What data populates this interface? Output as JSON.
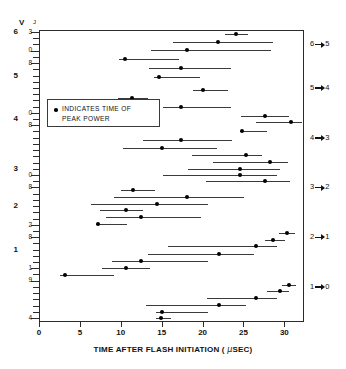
{
  "axis_header": {
    "v_label": "V",
    "j_label": "J"
  },
  "legend": {
    "line1": "INDICATES TIME OF",
    "line2": "PEAK POWER",
    "marker": "peak-power-dot"
  },
  "chart_data": {
    "type": "scatter",
    "title": "",
    "xlabel": "TIME AFTER FLASH INITIATION ( μSEC)",
    "ylabel": "V  J",
    "xlim": [
      0,
      32.4
    ],
    "ylim": [
      0,
      42
    ],
    "grid": false,
    "legend_position": "inside-left",
    "xticks": [
      0,
      5,
      10,
      15,
      20,
      25,
      30
    ],
    "xticklabels": [
      "0",
      "5",
      "10",
      "15",
      "20",
      "25",
      "30"
    ],
    "y_axis_note": "Left axis: vibrational level V (bold) and rotational level J (small). Each row is one V,J state; horizontal bar = lasing duration, dot = time of peak power.",
    "v_labels": [
      {
        "v": "6",
        "row": 0
      },
      {
        "v": "5",
        "row": 7
      },
      {
        "v": "4",
        "row": 14
      },
      {
        "v": "3",
        "row": 22
      },
      {
        "v": "2",
        "row": 28
      },
      {
        "v": "1",
        "row": 35
      }
    ],
    "j_labels": [
      {
        "j": "3",
        "row": 0
      },
      {
        "j": "0",
        "row": 3
      },
      {
        "j": "8",
        "row": 5
      },
      {
        "j": "0",
        "row": 13
      },
      {
        "j": "8",
        "row": 15
      },
      {
        "j": "0",
        "row": 23
      },
      {
        "j": "8",
        "row": 25
      },
      {
        "j": "2",
        "row": 31
      },
      {
        "j": "8",
        "row": 33
      },
      {
        "j": "1",
        "row": 38
      },
      {
        "j": "9",
        "row": 40
      },
      {
        "j": "4",
        "row": 46
      }
    ],
    "transitions": [
      {
        "label_from": "6",
        "label_to": "5",
        "row": 2
      },
      {
        "label_from": "5",
        "label_to": "4",
        "row": 9
      },
      {
        "label_from": "4",
        "label_to": "3",
        "row": 17
      },
      {
        "label_from": "3",
        "label_to": "2",
        "row": 25
      },
      {
        "label_from": "2",
        "label_to": "1",
        "row": 33
      },
      {
        "label_from": "1",
        "label_to": "0",
        "row": 41
      }
    ],
    "series": [
      {
        "name": "lasing-line",
        "start": 22.6,
        "end": 25.4,
        "peak": 24.0,
        "y": 31.5
      },
      {
        "name": "lasing-line",
        "start": 16.2,
        "end": 28.5,
        "peak": 21.8,
        "y": 30.3
      },
      {
        "name": "lasing-line",
        "start": 13.6,
        "end": 28.2,
        "peak": 18.0,
        "y": 29.0
      },
      {
        "name": "lasing-line",
        "start": 9.6,
        "end": 17.0,
        "peak": 10.4,
        "y": 27.7
      },
      {
        "name": "lasing-line",
        "start": 13.3,
        "end": 23.3,
        "peak": 17.2,
        "y": 26.4
      },
      {
        "name": "lasing-line",
        "start": 13.9,
        "end": 19.6,
        "peak": 14.5,
        "y": 25.1
      },
      {
        "name": "lasing-line",
        "start": 18.7,
        "end": 23.0,
        "peak": 19.9,
        "y": 23.1
      },
      {
        "name": "lasing-line",
        "start": 9.5,
        "end": 13.2,
        "peak": 11.2,
        "y": 21.9
      },
      {
        "name": "lasing-line",
        "start": 15.0,
        "end": 23.3,
        "peak": 17.3,
        "y": 20.6
      },
      {
        "name": "lasing-line",
        "start": 24.6,
        "end": 30.5,
        "peak": 27.5,
        "y": 19.3
      },
      {
        "name": "lasing-line",
        "start": 26.4,
        "end": 32.0,
        "peak": 30.7,
        "y": 18.3
      },
      {
        "name": "lasing-line",
        "start": 24.5,
        "end": 27.7,
        "peak": 24.7,
        "y": 17.0
      },
      {
        "name": "lasing-line",
        "start": 12.6,
        "end": 23.5,
        "peak": 17.3,
        "y": 15.6
      },
      {
        "name": "lasing-line",
        "start": 10.2,
        "end": 21.6,
        "peak": 14.9,
        "y": 14.5
      },
      {
        "name": "lasing-line",
        "start": 18.6,
        "end": 27.2,
        "peak": 25.2,
        "y": 13.4
      },
      {
        "name": "lasing-line",
        "start": 21.2,
        "end": 30.3,
        "peak": 28.1,
        "y": 12.4
      },
      {
        "name": "lasing-line",
        "start": 18.1,
        "end": 29.4,
        "peak": 24.5,
        "y": 11.4
      },
      {
        "name": "lasing-line",
        "start": 15.0,
        "end": 29.0,
        "peak": 24.4,
        "y": 10.5
      },
      {
        "name": "lasing-line",
        "start": 20.3,
        "end": 30.6,
        "peak": 27.5,
        "y": 9.5
      },
      {
        "name": "lasing-line",
        "start": 9.9,
        "end": 14.0,
        "peak": 11.4,
        "y": 8.2
      },
      {
        "name": "lasing-line",
        "start": 9.1,
        "end": 25.0,
        "peak": 18.0,
        "y": 7.1
      },
      {
        "name": "lasing-line",
        "start": 6.2,
        "end": 20.6,
        "peak": 14.3,
        "y": 6.1
      },
      {
        "name": "lasing-line",
        "start": 7.3,
        "end": 12.6,
        "peak": 10.5,
        "y": 5.2
      },
      {
        "name": "lasing-line",
        "start": 8.1,
        "end": 19.7,
        "peak": 12.3,
        "y": 4.2
      },
      {
        "name": "lasing-line",
        "start": 6.9,
        "end": 10.6,
        "peak": 7.1,
        "y": 3.2
      },
      {
        "name": "lasing-line",
        "start": 29.2,
        "end": 31.2,
        "peak": 30.2,
        "y": 1.8
      },
      {
        "name": "lasing-line",
        "start": 27.5,
        "end": 30.0,
        "peak": 28.5,
        "y": 0.8
      },
      {
        "name": "lasing-line",
        "start": 15.6,
        "end": 29.0,
        "peak": 26.4,
        "y": -0.2
      },
      {
        "name": "lasing-line",
        "start": 13.2,
        "end": 26.2,
        "peak": 21.9,
        "y": -1.3
      },
      {
        "name": "lasing-line",
        "start": 8.8,
        "end": 20.5,
        "peak": 12.3,
        "y": -2.4
      },
      {
        "name": "lasing-line",
        "start": 7.6,
        "end": 13.4,
        "peak": 10.5,
        "y": -3.4
      },
      {
        "name": "lasing-line",
        "start": 2.4,
        "end": 9.0,
        "peak": 3.0,
        "y": -4.4
      },
      {
        "name": "lasing-line",
        "start": 29.6,
        "end": 31.3,
        "peak": 30.4,
        "y": -5.9
      },
      {
        "name": "lasing-line",
        "start": 27.8,
        "end": 30.5,
        "peak": 29.3,
        "y": -6.9
      },
      {
        "name": "lasing-line",
        "start": 20.4,
        "end": 29.0,
        "peak": 26.4,
        "y": -7.9
      },
      {
        "name": "lasing-line",
        "start": 13.0,
        "end": 25.2,
        "peak": 21.9,
        "y": -8.9
      },
      {
        "name": "lasing-line",
        "start": 14.2,
        "end": 20.5,
        "peak": 14.9,
        "y": -9.9
      },
      {
        "name": "lasing-line",
        "start": 14.2,
        "end": 16.0,
        "peak": 14.8,
        "y": -10.8
      }
    ]
  }
}
